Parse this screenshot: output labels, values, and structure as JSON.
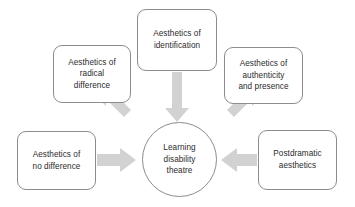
{
  "diagram": {
    "center": {
      "label": "Learning\ndisability\ntheatre",
      "shape": "circle"
    },
    "nodes": [
      {
        "id": "radical-difference",
        "label": "Aesthetics of\nradical\ndifference",
        "shape": "rounded-rect"
      },
      {
        "id": "identification",
        "label": "Aesthetics of\nidentification",
        "shape": "rounded-rect"
      },
      {
        "id": "authenticity",
        "label": "Aesthetics of\nauthenticity\nand presence",
        "shape": "rounded-rect"
      },
      {
        "id": "no-difference",
        "label": "Aesthetics of\nno  difference",
        "shape": "rounded-rect"
      },
      {
        "id": "postdramatic",
        "label": "Postdramatic\naesthetics",
        "shape": "rounded-rect"
      }
    ],
    "arrows": [
      {
        "id": "radical-difference-to-center",
        "direction": "down-right"
      },
      {
        "id": "identification-to-center",
        "direction": "down"
      },
      {
        "id": "authenticity-to-center",
        "direction": "down-left"
      },
      {
        "id": "no-difference-to-center",
        "direction": "right"
      },
      {
        "id": "postdramatic-to-center",
        "direction": "left"
      }
    ],
    "colors": {
      "arrow_fill": "#d2d2d2",
      "node_border": "#8c8c8c",
      "text": "#2b2b2b",
      "background": "#ffffff"
    }
  }
}
